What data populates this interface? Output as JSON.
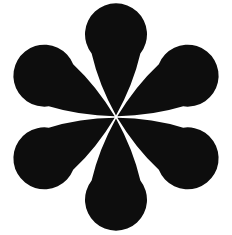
{
  "image": {
    "width": 232,
    "height": 235,
    "background_color": "#ffffff",
    "subject": "six-petal-rosette-flower-silhouette",
    "alt_text": "Black six-petal flower rosette silhouette on white background"
  },
  "rosette": {
    "name": "six-petal-rosette",
    "fill_color": "#0d0d0d",
    "stroke_color": "none",
    "petal_count": 6,
    "center": {
      "x": 116,
      "y": 117
    },
    "bulb_radius": 31,
    "bulb_distance": 75,
    "tip_gap_degrees": 7,
    "bounds": {
      "left": 14,
      "top": 13,
      "right": 216,
      "bottom": 223
    },
    "petals": [
      {
        "name": "petal-top",
        "angle_deg": -90,
        "bulb_center": {
          "x": 116,
          "y": 42
        }
      },
      {
        "name": "petal-upper-right",
        "angle_deg": -30,
        "bulb_center": {
          "x": 181,
          "y": 80
        }
      },
      {
        "name": "petal-lower-right",
        "angle_deg": 30,
        "bulb_center": {
          "x": 181,
          "y": 155
        }
      },
      {
        "name": "petal-bottom",
        "angle_deg": 90,
        "bulb_center": {
          "x": 116,
          "y": 192
        }
      },
      {
        "name": "petal-lower-left",
        "angle_deg": 150,
        "bulb_center": {
          "x": 51,
          "y": 155
        }
      },
      {
        "name": "petal-upper-left",
        "angle_deg": -150,
        "bulb_center": {
          "x": 51,
          "y": 80
        }
      }
    ]
  }
}
